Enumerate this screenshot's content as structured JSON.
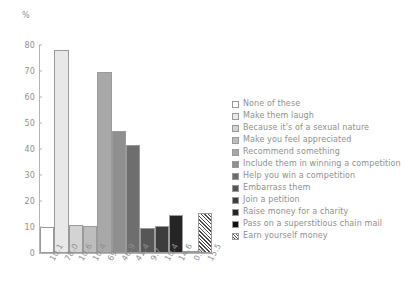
{
  "chart_data": {
    "type": "bar",
    "title": "",
    "subtitle": "",
    "xlabel": "",
    "ylabel": "%",
    "ylim": [
      0,
      80
    ],
    "y_ticks": [
      0,
      10,
      20,
      30,
      40,
      50,
      60,
      70,
      80
    ],
    "grid": false,
    "legend_position": "right",
    "categories": [
      "None of these",
      "Make them laugh",
      "Because it's of a sexual nature",
      "Make you feel appreciated",
      "Recommend something",
      "Include them in winning a competition",
      "Help you win a competition",
      "Embarrass them",
      "Join a petition",
      "Raise money for a charity",
      "Pass on a superstitious chain mail",
      "Earn yourself money"
    ],
    "values": [
      10.1,
      78.0,
      10.6,
      10.4,
      69.6,
      46.9,
      41.4,
      9.7,
      10.4,
      14.6,
      0.5,
      15.5
    ],
    "data_labels": [
      "10.1",
      "78.0",
      "10.6",
      "10.4",
      "69.6",
      "46.9",
      "41.4",
      "9.7",
      "10.4",
      "14.6",
      "0.5",
      "15.5"
    ],
    "bar_fills": [
      "#ffffff",
      "#e8e8e8",
      "#d3d3d3",
      "#bdbdbd",
      "#a8a8a8",
      "#8f8f8f",
      "#6e6e6e",
      "#565656",
      "#3d3d3d",
      "#252525",
      "#ffffff",
      "#ffffff"
    ],
    "bar_patterns": [
      "solid",
      "solid",
      "solid",
      "solid",
      "solid",
      "solid",
      "solid",
      "solid",
      "solid",
      "solid",
      "solid",
      "hatch"
    ],
    "bar_border": "#9a9a9a"
  },
  "axes": {
    "y_unit_label": "%",
    "y_tick_labels": [
      "0",
      "10",
      "20",
      "30",
      "40",
      "50",
      "60",
      "70",
      "80"
    ],
    "x_tick_labels": [
      "10.1",
      "78.0",
      "10.6",
      "10.4",
      "69.6",
      "46.9",
      "41.4",
      "9.7",
      "10.4",
      "14.6",
      "0.5",
      "15.5"
    ]
  },
  "legend": {
    "items": [
      {
        "label": "None of these",
        "swatch": "#ffffff",
        "pattern": "solid"
      },
      {
        "label": "Make them laugh",
        "swatch": "#e8e8e8",
        "pattern": "solid"
      },
      {
        "label": "Because it's of a sexual nature",
        "swatch": "#d3d3d3",
        "pattern": "solid"
      },
      {
        "label": "Make you feel appreciated",
        "swatch": "#bdbdbd",
        "pattern": "solid"
      },
      {
        "label": "Recommend something",
        "swatch": "#a8a8a8",
        "pattern": "solid"
      },
      {
        "label": "Include them in winning a competition",
        "swatch": "#8f8f8f",
        "pattern": "solid"
      },
      {
        "label": "Help you win a competition",
        "swatch": "#6e6e6e",
        "pattern": "solid"
      },
      {
        "label": "Embarrass them",
        "swatch": "#565656",
        "pattern": "solid"
      },
      {
        "label": "Join a petition",
        "swatch": "#3d3d3d",
        "pattern": "solid"
      },
      {
        "label": "Raise money for a charity",
        "swatch": "#252525",
        "pattern": "solid"
      },
      {
        "label": "Pass on a superstitious chain mail",
        "swatch": "#111111",
        "pattern": "solid"
      },
      {
        "label": "Earn yourself money",
        "swatch": "#ffffff",
        "pattern": "hatch"
      }
    ]
  },
  "colors": {
    "axis": "#b4b4b4",
    "text": "#8f8f8f",
    "background": "#ffffff"
  }
}
